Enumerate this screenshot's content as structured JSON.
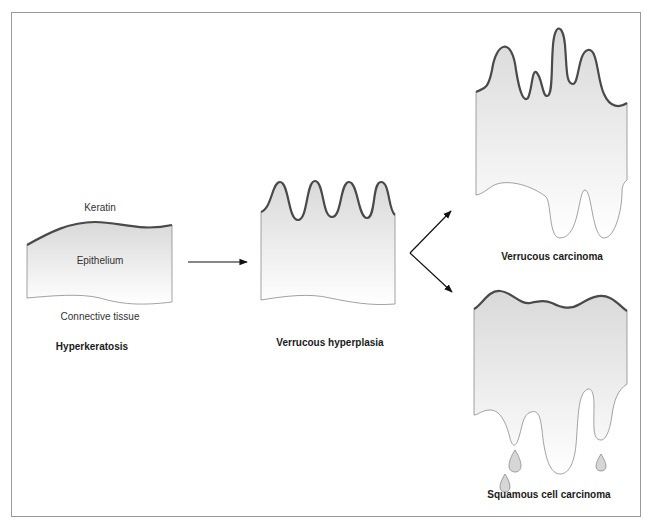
{
  "diagram": {
    "type": "pathology-progression",
    "stages": {
      "hyperkeratosis": {
        "title": "Hyperkeratosis",
        "labels": {
          "keratin": "Keratin",
          "epithelium": "Epithelium",
          "connective_tissue": "Connective tissue"
        }
      },
      "verrucous_hyperplasia": {
        "title": "Verrucous hyperplasia"
      },
      "verrucous_carcinoma": {
        "title": "Verrucous carcinoma"
      },
      "squamous_cell_carcinoma": {
        "title": "Squamous cell carcinoma"
      }
    },
    "flow": [
      {
        "from": "Hyperkeratosis",
        "to": "Verrucous hyperplasia"
      },
      {
        "from": "Verrucous hyperplasia",
        "to": "Verrucous carcinoma"
      },
      {
        "from": "Verrucous hyperplasia",
        "to": "Squamous cell carcinoma"
      }
    ],
    "colors": {
      "keratin_line": "#4a4a4a",
      "epithelium_fill_top": "#dcdcdc",
      "epithelium_fill_bottom": "#ffffff",
      "outline": "#7a7a7a",
      "arrow": "#111111",
      "frame": "#9a9a9a"
    }
  }
}
